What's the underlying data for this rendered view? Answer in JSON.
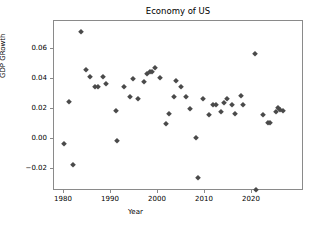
{
  "chart_data": {
    "type": "scatter",
    "title": "Economy of US",
    "xlabel": "Year",
    "ylabel": "GDP GRowth",
    "grid": false,
    "legend": null,
    "marker": "diamond",
    "marker_color": "#4a4a4a",
    "xlim": [
      1978.2,
      1978.2
    ],
    "ylim": [
      -0.0395,
      0.0775
    ],
    "xticks": [
      1980,
      1990,
      2000,
      2010,
      2020
    ],
    "xtick_labels": [
      "1980",
      "1990",
      "2000",
      "2010",
      "2020"
    ],
    "yticks": [
      -0.02,
      0.0,
      0.02,
      0.04,
      0.06
    ],
    "ytick_labels": [
      "−0.02",
      "0.00",
      "0.02",
      "0.04",
      "0.06"
    ],
    "x": [
      1980,
      1981,
      1982,
      1983,
      1984,
      1985,
      1986,
      1987,
      1988,
      1989,
      1991,
      1992,
      1993,
      1994,
      1995,
      1996,
      1997,
      1998,
      1999,
      2000,
      2002,
      2003,
      2004,
      2005,
      2006,
      2007,
      2008,
      2009,
      2010,
      2011,
      2012,
      2013,
      2014,
      2015,
      2016,
      2017,
      2018,
      2019,
      2021,
      2022,
      2023,
      2024,
      2025,
      2026,
      2027
    ],
    "y": [
      -0.003,
      0.025,
      -0.0175,
      0.0715,
      0.0415,
      0.046,
      0.035,
      0.035,
      0.0415,
      0.037,
      -0.001,
      0.019,
      0.035,
      0.04,
      0.028,
      0.027,
      0.038,
      0.0435,
      0.0445,
      0.0475,
      0.041,
      0.01,
      0.017,
      0.028,
      0.039,
      0.035,
      0.028,
      0.001,
      0.02,
      -0.026,
      0.027,
      0.016,
      0.023,
      0.018,
      0.024,
      0.027,
      0.017,
      0.023,
      0.029,
      0.057,
      -0.034,
      0.016,
      0.01,
      0.011,
      0.018,
      0.02,
      0.019
    ],
    "points": [
      {
        "x": 1980.0,
        "y": -0.003
      },
      {
        "x": 1981.0,
        "y": 0.025
      },
      {
        "x": 1982.0,
        "y": -0.0175
      },
      {
        "x": 1983.6,
        "y": 0.0715
      },
      {
        "x": 1984.6,
        "y": 0.046
      },
      {
        "x": 1985.6,
        "y": 0.0415
      },
      {
        "x": 1986.6,
        "y": 0.0348
      },
      {
        "x": 1987.3,
        "y": 0.0348
      },
      {
        "x": 1988.2,
        "y": 0.0415
      },
      {
        "x": 1989.0,
        "y": 0.037
      },
      {
        "x": 1991.0,
        "y": 0.019
      },
      {
        "x": 1991.2,
        "y": -0.001
      },
      {
        "x": 1992.8,
        "y": 0.0348
      },
      {
        "x": 1994.0,
        "y": 0.028
      },
      {
        "x": 1994.6,
        "y": 0.04
      },
      {
        "x": 1995.8,
        "y": 0.027
      },
      {
        "x": 1997.0,
        "y": 0.038
      },
      {
        "x": 1997.6,
        "y": 0.0435
      },
      {
        "x": 1998.2,
        "y": 0.0445
      },
      {
        "x": 1998.8,
        "y": 0.045
      },
      {
        "x": 1999.4,
        "y": 0.0475
      },
      {
        "x": 2000.4,
        "y": 0.041
      },
      {
        "x": 2001.6,
        "y": 0.01
      },
      {
        "x": 2002.3,
        "y": 0.017
      },
      {
        "x": 2003.4,
        "y": 0.028
      },
      {
        "x": 2003.9,
        "y": 0.039
      },
      {
        "x": 2004.8,
        "y": 0.035
      },
      {
        "x": 2006.0,
        "y": 0.028
      },
      {
        "x": 2006.8,
        "y": 0.02
      },
      {
        "x": 2008.0,
        "y": 0.001
      },
      {
        "x": 2008.6,
        "y": -0.026
      },
      {
        "x": 2009.6,
        "y": 0.027
      },
      {
        "x": 2010.8,
        "y": 0.016
      },
      {
        "x": 2011.8,
        "y": 0.023
      },
      {
        "x": 2012.4,
        "y": 0.0225
      },
      {
        "x": 2013.4,
        "y": 0.018
      },
      {
        "x": 2014.0,
        "y": 0.024
      },
      {
        "x": 2014.6,
        "y": 0.027
      },
      {
        "x": 2015.8,
        "y": 0.0225
      },
      {
        "x": 2016.4,
        "y": 0.017
      },
      {
        "x": 2017.6,
        "y": 0.029
      },
      {
        "x": 2018.0,
        "y": 0.0225
      },
      {
        "x": 2020.6,
        "y": 0.057
      },
      {
        "x": 2020.9,
        "y": -0.034
      },
      {
        "x": 2022.4,
        "y": 0.016
      },
      {
        "x": 2023.4,
        "y": 0.0105
      },
      {
        "x": 2023.9,
        "y": 0.011
      },
      {
        "x": 2025.0,
        "y": 0.018
      },
      {
        "x": 2025.6,
        "y": 0.0205
      },
      {
        "x": 2026.0,
        "y": 0.0195
      },
      {
        "x": 2026.7,
        "y": 0.019
      }
    ]
  }
}
